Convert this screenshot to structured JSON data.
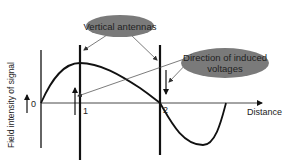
{
  "diagram": {
    "axis": {
      "y_label": "Field intensity of signal",
      "x_label": "Distance",
      "origin_label": "0"
    },
    "antennas": [
      {
        "label": "1",
        "voltage_direction": "up"
      },
      {
        "label": "2",
        "voltage_direction": "down"
      }
    ],
    "callouts": {
      "vertical_antennas": "Vertical antennas",
      "induced_voltages_line1": "Direction of induced",
      "induced_voltages_line2": "voltages"
    },
    "colors": {
      "ellipse_fill": "#7a7a7a",
      "line": "#111111",
      "text": "#222222"
    }
  }
}
